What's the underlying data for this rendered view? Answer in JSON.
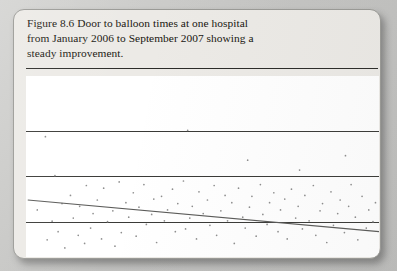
{
  "figure": {
    "label": "Figure 8.6",
    "caption_lines": [
      "Figure 8.6 Door to balloon times at one hospital",
      "from January 2006 to September 2007 showing a",
      "steady improvement."
    ],
    "caption_full": "Figure 8.6 Door to balloon times at one hospital from January 2006 to September 2007 showing a steady improvement.",
    "card_color": "#eceae6",
    "page_color": "#c9c9c9",
    "plot_background": "#ffffff",
    "gridline_color": "#3a3a37",
    "point_color": "#8e8e8e",
    "trendline_color": "#5a5a58"
  },
  "chart_data": {
    "type": "scatter",
    "title": "Door to balloon times at one hospital",
    "subtitle": "January 2006 to September 2007 showing a steady improvement",
    "xlabel": "",
    "ylabel": "",
    "grid": true,
    "legend": "none",
    "axis_tick_labels": [],
    "gridline_positions_px": [
      55,
      100,
      146
    ],
    "xlim": [
      0,
      100
    ],
    "ylim": [
      0,
      100
    ],
    "trendline": {
      "type": "linear",
      "description": "downward sloping least-squares fit indicating steady improvement",
      "x_start": 0.5,
      "y_start": 68.5,
      "x_end": 100,
      "y_end": 86.0
    },
    "x": [
      3.2,
      6.0,
      7.4,
      9.1,
      10.2,
      11.0,
      12.6,
      13.4,
      14.8,
      15.2,
      16.6,
      17.1,
      18.3,
      19.0,
      20.2,
      21.4,
      22.0,
      23.1,
      24.6,
      25.2,
      26.4,
      27.0,
      28.3,
      29.1,
      30.4,
      31.2,
      32.0,
      33.4,
      34.1,
      35.6,
      36.2,
      37.0,
      38.4,
      39.2,
      40.1,
      41.5,
      42.3,
      43.0,
      44.6,
      45.2,
      46.4,
      47.1,
      48.3,
      49.0,
      50.2,
      51.4,
      52.1,
      53.3,
      54.0,
      55.2,
      56.4,
      57.1,
      58.3,
      59.0,
      60.2,
      61.4,
      62.1,
      63.3,
      64.0,
      65.2,
      66.4,
      67.1,
      68.3,
      69.0,
      70.2,
      71.4,
      72.1,
      73.3,
      74.0,
      75.2,
      76.4,
      77.1,
      78.3,
      79.0,
      80.2,
      81.4,
      82.1,
      83.3,
      84.0,
      85.2,
      86.4,
      87.1,
      88.3,
      89.0,
      90.2,
      91.4,
      92.1,
      93.3,
      94.0,
      95.2,
      96.4,
      97.1,
      98.3,
      99.0,
      5.5,
      8.2,
      45.8,
      62.8,
      77.5,
      90.5
    ],
    "y": [
      74.0,
      90.5,
      80.2,
      86.0,
      70.5,
      95.0,
      66.0,
      78.5,
      88.0,
      72.0,
      92.5,
      60.5,
      84.0,
      76.0,
      68.5,
      90.0,
      62.0,
      80.5,
      74.5,
      94.0,
      58.5,
      86.5,
      70.0,
      78.0,
      64.5,
      88.5,
      72.5,
      60.0,
      82.0,
      76.5,
      68.0,
      92.0,
      66.5,
      80.0,
      74.0,
      62.5,
      86.0,
      70.5,
      58.0,
      84.5,
      78.5,
      72.0,
      90.0,
      64.0,
      76.0,
      68.5,
      82.5,
      60.5,
      88.0,
      74.5,
      66.0,
      80.0,
      70.0,
      92.5,
      62.0,
      78.0,
      84.0,
      72.5,
      66.5,
      88.5,
      60.0,
      76.5,
      82.0,
      70.0,
      64.5,
      86.0,
      74.0,
      68.0,
      90.0,
      62.5,
      78.5,
      72.0,
      84.5,
      66.0,
      80.0,
      60.5,
      88.0,
      74.5,
      70.5,
      92.0,
      64.0,
      82.5,
      76.0,
      68.5,
      86.5,
      72.0,
      60.0,
      78.0,
      90.5,
      66.5,
      84.0,
      74.0,
      80.5,
      70.0,
      33.5,
      55.0,
      30.0,
      46.5,
      52.0,
      44.0
    ]
  }
}
